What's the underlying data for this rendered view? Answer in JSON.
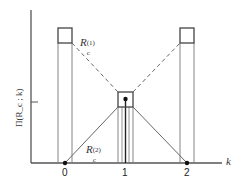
{
  "diagram": {
    "axes": {
      "x_label": "k",
      "y_label": "Π(R_c ; k)",
      "x_ticks": [
        "0",
        "1",
        "2"
      ]
    },
    "annotations": {
      "upper_curve": {
        "base": "R",
        "sub": "c",
        "sup": "(1)"
      },
      "lower_curve": {
        "base": "R",
        "sub": "c",
        "sup": "(2)"
      }
    },
    "colors": {
      "line": "#555555",
      "dashed": "#666666",
      "point": "#111111"
    }
  }
}
